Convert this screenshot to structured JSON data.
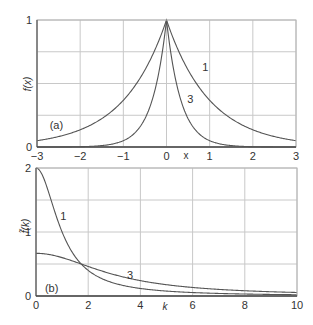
{
  "colors": {
    "background": "#ffffff",
    "grid": "#c8c8c8",
    "frame": "#b4b4b4",
    "axis": "#444444",
    "curve": "#555555",
    "text": "#333333"
  },
  "chart_data": [
    {
      "type": "line",
      "panel_label": "(a)",
      "title": "",
      "xlabel": "x",
      "ylabel": "f(x)",
      "xlim": [
        -3,
        3
      ],
      "ylim": [
        0,
        1
      ],
      "xticks": [
        -3,
        -2,
        -1,
        0,
        1,
        2,
        3
      ],
      "xtick_labels": [
        "−3",
        "−2",
        "−1",
        "0",
        "1",
        "2",
        "3"
      ],
      "yticks": [
        0,
        1
      ],
      "ytick_labels": [
        "0",
        "1"
      ],
      "ygrid": [
        0,
        0.25,
        0.5,
        0.75,
        1
      ],
      "grid": true,
      "legend": "none (curves labeled inline)",
      "x": [
        -3,
        -2.5,
        -2,
        -1.5,
        -1,
        -0.5,
        0,
        0.5,
        1,
        1.5,
        2,
        2.5,
        3
      ],
      "series": [
        {
          "name": "1",
          "formula": "exp(-|x|)",
          "values": [
            0.05,
            0.082,
            0.135,
            0.223,
            0.368,
            0.607,
            1,
            0.607,
            0.368,
            0.223,
            0.135,
            0.082,
            0.05
          ]
        },
        {
          "name": "3",
          "formula": "exp(-3|x|)",
          "values": [
            0.0001,
            0.0006,
            0.0025,
            0.011,
            0.05,
            0.223,
            1,
            0.223,
            0.05,
            0.011,
            0.0025,
            0.0006,
            0.0001
          ]
        }
      ],
      "annotations": [
        {
          "text": "1",
          "x": 0.9,
          "y": 0.63
        },
        {
          "text": "3",
          "x": 0.55,
          "y": 0.38
        },
        {
          "text": "(a)",
          "x": -2.55,
          "y": 0.17
        }
      ]
    },
    {
      "type": "line",
      "panel_label": "(b)",
      "title": "",
      "xlabel": "k",
      "ylabel": "f̃(k)",
      "xlim": [
        0,
        10
      ],
      "ylim": [
        0,
        2
      ],
      "xticks": [
        0,
        2,
        4,
        6,
        8,
        10
      ],
      "xtick_labels": [
        "0",
        "2",
        "4",
        "6",
        "8",
        "10"
      ],
      "yticks": [
        0,
        1,
        2
      ],
      "ytick_labels": [
        "0",
        "1",
        "2"
      ],
      "ygrid": [
        0,
        0.5,
        1,
        1.5,
        2
      ],
      "grid": true,
      "legend": "none (curves labeled inline)",
      "x": [
        0,
        1,
        2,
        3,
        4,
        5,
        6,
        7,
        8,
        9,
        10
      ],
      "series": [
        {
          "name": "1",
          "formula": "2/(1+k^2)",
          "values": [
            2,
            1,
            0.4,
            0.2,
            0.118,
            0.077,
            0.054,
            0.04,
            0.031,
            0.024,
            0.02
          ]
        },
        {
          "name": "3",
          "formula": "6/(9+k^2)",
          "values": [
            0.667,
            0.6,
            0.462,
            0.333,
            0.24,
            0.176,
            0.133,
            0.103,
            0.082,
            0.067,
            0.055
          ]
        }
      ],
      "annotations": [
        {
          "text": "1",
          "x": 1.05,
          "y": 1.25
        },
        {
          "text": "3",
          "x": 3.6,
          "y": 0.33
        },
        {
          "text": "(b)",
          "x": 0.6,
          "y": 0.13
        }
      ]
    }
  ]
}
